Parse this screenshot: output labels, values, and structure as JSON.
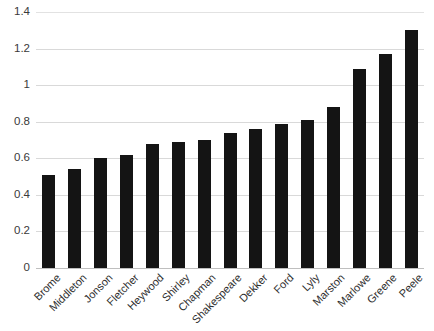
{
  "chart_data": {
    "type": "bar",
    "title": "",
    "subtitle": "",
    "xlabel": "",
    "ylabel": "",
    "categories": [
      "Brome",
      "Middleton",
      "Jonson",
      "Fletcher",
      "Heywood",
      "Shirley",
      "Chapman",
      "Shakespeare",
      "Dekker",
      "Ford",
      "Lyly",
      "Marston",
      "Marlowe",
      "Greene",
      "Peele"
    ],
    "values": [
      0.51,
      0.54,
      0.6,
      0.62,
      0.68,
      0.69,
      0.7,
      0.74,
      0.76,
      0.79,
      0.81,
      0.88,
      1.09,
      1.17,
      1.3
    ],
    "ylim": [
      0,
      1.4
    ],
    "xlim": [
      0,
      15
    ],
    "y_ticks": [
      0,
      0.2,
      0.4,
      0.6,
      0.8,
      1,
      1.2,
      1.4
    ],
    "y_tick_labels": [
      "0",
      "0.2",
      "0.4",
      "0.6",
      "0.8",
      "1",
      "1.2",
      "1.4"
    ],
    "grid": "horizontal",
    "legend": "none",
    "legend_position": "",
    "bar_color": "#141414",
    "gridline_color": "#d9d9d9",
    "background_color": "#ffffff",
    "axis_text_color": "#2e2e2e",
    "x_label_rotation": -45
  }
}
